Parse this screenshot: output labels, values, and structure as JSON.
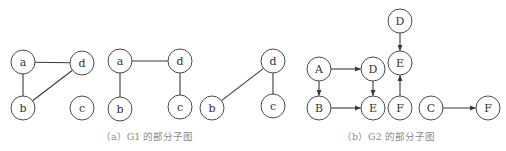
{
  "figure": {
    "g1": {
      "caption": "（a）G1 的部分子图",
      "subgraphs": [
        {
          "nodes": [
            {
              "id": "a",
              "label": "a",
              "x": 23,
              "y": 62
            },
            {
              "id": "d",
              "label": "d",
              "x": 82,
              "y": 63
            },
            {
              "id": "b",
              "label": "b",
              "x": 23,
              "y": 108
            },
            {
              "id": "c",
              "label": "c",
              "x": 82,
              "y": 108
            }
          ],
          "edges": [
            [
              "a",
              "d"
            ],
            [
              "a",
              "b"
            ],
            [
              "b",
              "d"
            ]
          ],
          "directed": false
        },
        {
          "nodes": [
            {
              "id": "a",
              "label": "a",
              "x": 120,
              "y": 61
            },
            {
              "id": "d",
              "label": "d",
              "x": 180,
              "y": 61
            },
            {
              "id": "b",
              "label": "b",
              "x": 120,
              "y": 109
            },
            {
              "id": "c",
              "label": "c",
              "x": 180,
              "y": 107
            }
          ],
          "edges": [
            [
              "a",
              "d"
            ],
            [
              "a",
              "b"
            ],
            [
              "d",
              "c"
            ]
          ],
          "directed": false
        },
        {
          "nodes": [
            {
              "id": "b",
              "label": "b",
              "x": 212,
              "y": 108
            },
            {
              "id": "d",
              "label": "d",
              "x": 273,
              "y": 61
            },
            {
              "id": "c",
              "label": "c",
              "x": 273,
              "y": 106
            }
          ],
          "edges": [
            [
              "b",
              "d"
            ],
            [
              "d",
              "c"
            ]
          ],
          "directed": false
        }
      ]
    },
    "g2": {
      "caption": "（b）G2 的部分子图",
      "subgraphs": [
        {
          "nodes": [
            {
              "id": "A",
              "label": "A",
              "x": 319,
              "y": 69
            },
            {
              "id": "D",
              "label": "D",
              "x": 373,
              "y": 69
            },
            {
              "id": "B",
              "label": "B",
              "x": 319,
              "y": 108
            },
            {
              "id": "E",
              "label": "E",
              "x": 373,
              "y": 108
            }
          ],
          "edges": [
            [
              "A",
              "D"
            ],
            [
              "A",
              "B"
            ],
            [
              "D",
              "E"
            ],
            [
              "B",
              "E"
            ]
          ],
          "directed": true
        },
        {
          "nodes": [
            {
              "id": "D",
              "label": "D",
              "x": 400,
              "y": 21
            },
            {
              "id": "E",
              "label": "E",
              "x": 400,
              "y": 63
            },
            {
              "id": "F",
              "label": "F",
              "x": 400,
              "y": 108
            }
          ],
          "edges": [
            [
              "D",
              "E"
            ],
            [
              "F",
              "E"
            ]
          ],
          "directed": true
        },
        {
          "nodes": [
            {
              "id": "C",
              "label": "C",
              "x": 431,
              "y": 108
            },
            {
              "id": "F",
              "label": "F",
              "x": 488,
              "y": 108
            }
          ],
          "edges": [
            [
              "C",
              "F"
            ]
          ],
          "directed": true
        }
      ]
    },
    "node_radius": 12,
    "colors": {
      "stroke": "#4a4a4a",
      "edge": "#3a3a3a",
      "caption": "#8a8a8a"
    }
  }
}
